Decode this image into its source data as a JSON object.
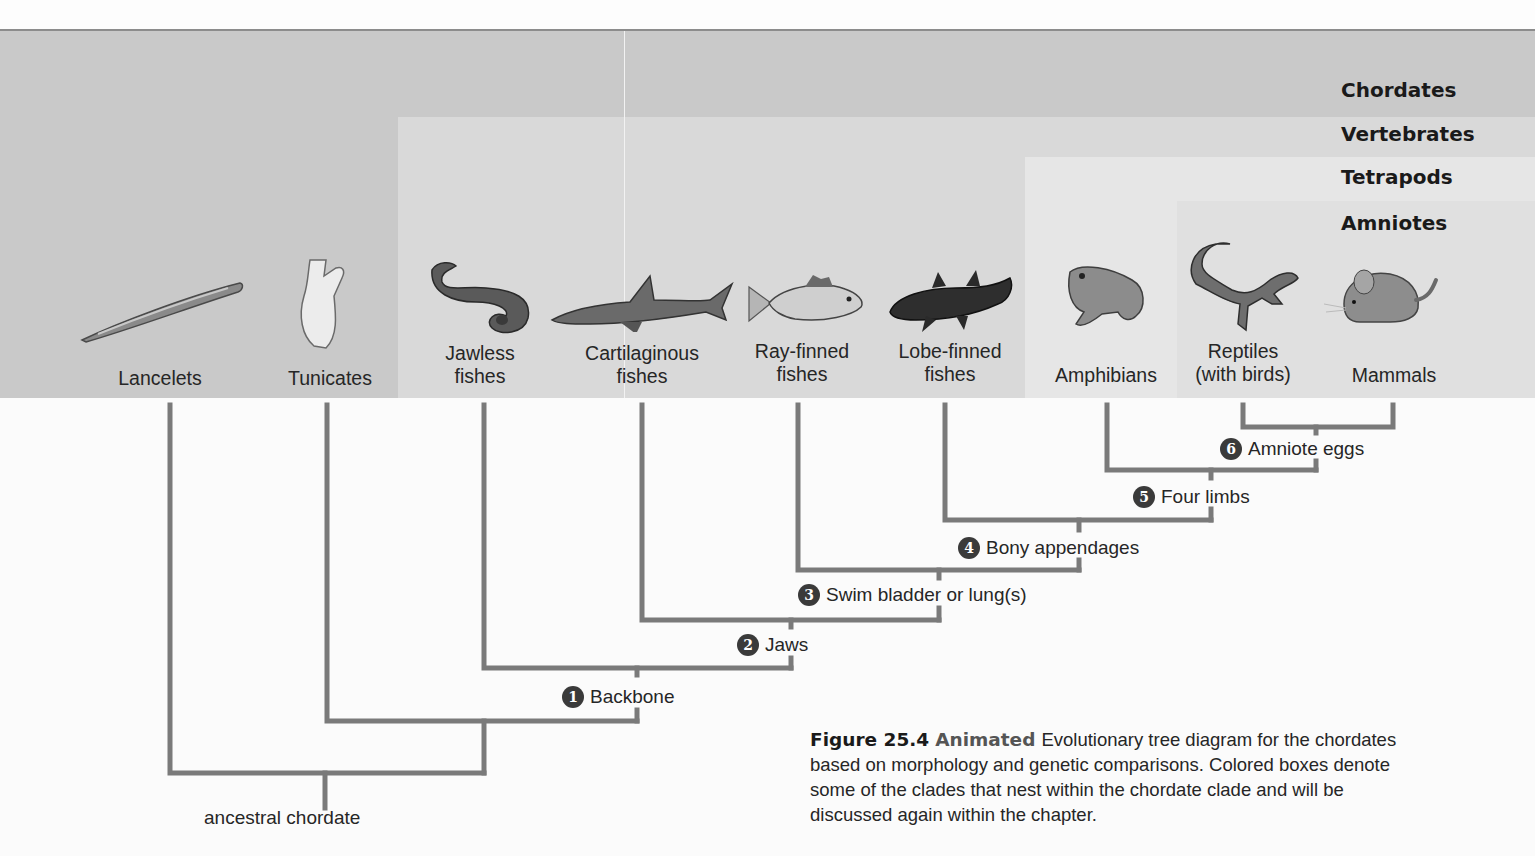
{
  "clades": [
    {
      "name": "Chordates",
      "top": 78
    },
    {
      "name": "Vertebrates",
      "top": 122
    },
    {
      "name": "Tetrapods",
      "top": 165
    },
    {
      "name": "Amniotes",
      "top": 211
    }
  ],
  "taxa": [
    {
      "label": "Lancelets",
      "x": 160,
      "y": 367
    },
    {
      "label": "Tunicates",
      "x": 330,
      "y": 367
    },
    {
      "label": "Jawless\nfishes",
      "x": 480,
      "y": 342
    },
    {
      "label": "Cartilaginous\nfishes",
      "x": 642,
      "y": 342
    },
    {
      "label": "Ray-finned\nfishes",
      "x": 802,
      "y": 340
    },
    {
      "label": "Lobe-finned\nfishes",
      "x": 950,
      "y": 340
    },
    {
      "label": "Amphibians",
      "x": 1106,
      "y": 364
    },
    {
      "label": "Reptiles\n(with birds)",
      "x": 1243,
      "y": 340
    },
    {
      "label": "Mammals",
      "x": 1394,
      "y": 364
    }
  ],
  "characters": [
    {
      "num": "1",
      "label": "Backbone",
      "x": 562,
      "y": 686
    },
    {
      "num": "2",
      "label": "Jaws",
      "x": 737,
      "y": 634
    },
    {
      "num": "3",
      "label": "Swim bladder or lung(s)",
      "x": 798,
      "y": 584
    },
    {
      "num": "4",
      "label": "Bony appendages",
      "x": 958,
      "y": 537
    },
    {
      "num": "5",
      "label": "Four limbs",
      "x": 1133,
      "y": 486
    },
    {
      "num": "6",
      "label": "Amniote eggs",
      "x": 1220,
      "y": 438
    }
  ],
  "root_label": "ancestral chordate",
  "caption": {
    "figure": "Figure 25.4",
    "tag": "Animated",
    "text": "Evolutionary tree diagram for the chordates based on morphology and genetic comparisons. Colored boxes denote some of the clades that nest within the chordate clade and will be discussed again within the chapter."
  },
  "colors": {
    "branch": "#7a7a7a",
    "badge": "#3a3a3a",
    "chordates_box": "#c9c9c9",
    "vertebrates_box": "#d9d9d9",
    "tetrapods_box": "#e6e6e6",
    "amniotes_box": "#e0e0e0"
  }
}
